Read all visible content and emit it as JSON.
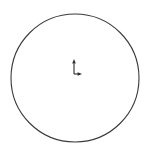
{
  "canvas": {
    "width": 149,
    "height": 152,
    "background_color": "#ffffff",
    "title": "Circle with coordinate origin marker"
  },
  "shapes": {
    "circle": {
      "name": "circle-outline",
      "center_x": 75,
      "center_y": 78,
      "radius": 64,
      "stroke_color": "#3a3a3a",
      "stroke_width": 1.1,
      "fill": "none",
      "left_edge_x": 11,
      "right_edge_x": 139,
      "top_edge_y": 14,
      "bottom_edge_y": 142
    },
    "origin_marker": {
      "name": "coordinate-origin-marker",
      "origin_x": 74,
      "origin_y": 74,
      "stroke_color": "#2b2b2b",
      "stroke_width": 1.1,
      "y_axis": {
        "label": "y-axis-arrow",
        "from_x": 74,
        "from_y": 74,
        "to_x": 74,
        "to_y": 60,
        "length": 14,
        "direction": "up",
        "arrowhead": true
      },
      "x_axis": {
        "label": "x-axis-arrow",
        "from_x": 74,
        "from_y": 74,
        "to_x": 82,
        "to_y": 74,
        "length": 8,
        "direction": "right",
        "arrowhead": true
      }
    }
  }
}
